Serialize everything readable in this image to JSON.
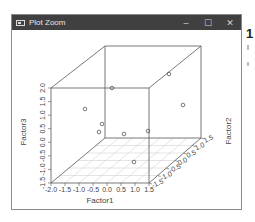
{
  "window": {
    "title": "Plot Zoom",
    "controls": {
      "minimize": "–",
      "maximize": "☐",
      "close": "✕"
    }
  },
  "background": {
    "partial_text": "1"
  },
  "chart_data": {
    "type": "scatter3d",
    "title": "",
    "xlabel": "Factor1",
    "ylabel": "Factor2",
    "zlabel": "Factor3",
    "x_ticks": [
      "-2.0",
      "-1.5",
      "-1.0",
      "-0.5",
      "0.0",
      "0.5",
      "1.0",
      "1.5"
    ],
    "y_ticks": [
      "-1.5",
      "-1.0",
      "-0.5",
      "0.0",
      "0.5",
      "1.0",
      "1.5"
    ],
    "z_ticks": [
      "-1.5",
      "-1.0",
      "-0.5",
      "0.0",
      "0.5",
      "1.0",
      "1.5",
      "2.0"
    ],
    "xlim": [
      -2.0,
      1.5
    ],
    "ylim": [
      -1.5,
      1.5
    ],
    "zlim": [
      -1.5,
      2.0
    ],
    "grid": "floor",
    "box": true,
    "points_screen": [
      {
        "sx": 84,
        "sy": 108
      },
      {
        "sx": 101,
        "sy": 123
      },
      {
        "sx": 98,
        "sy": 131
      },
      {
        "sx": 123,
        "sy": 133
      },
      {
        "sx": 147,
        "sy": 130
      },
      {
        "sx": 133,
        "sy": 161
      },
      {
        "sx": 111,
        "sy": 87
      },
      {
        "sx": 168,
        "sy": 73
      },
      {
        "sx": 182,
        "sy": 104
      }
    ],
    "points": [
      {
        "x": -1.2,
        "y": -1.5,
        "z": 0.7
      },
      {
        "x": -0.8,
        "y": -1.0,
        "z": 0.6
      },
      {
        "x": -1.4,
        "y": 0.5,
        "z": -0.8
      },
      {
        "x": 0.0,
        "y": -1.0,
        "z": -0.2
      },
      {
        "x": 1.5,
        "y": -1.5,
        "z": 0.2
      },
      {
        "x": 0.8,
        "y": -0.5,
        "z": -1.3
      },
      {
        "x": -0.2,
        "y": -1.0,
        "z": 1.7
      },
      {
        "x": 0.5,
        "y": 0.8,
        "z": 1.2
      },
      {
        "x": 1.2,
        "y": 0.5,
        "z": 0.6
      }
    ]
  }
}
